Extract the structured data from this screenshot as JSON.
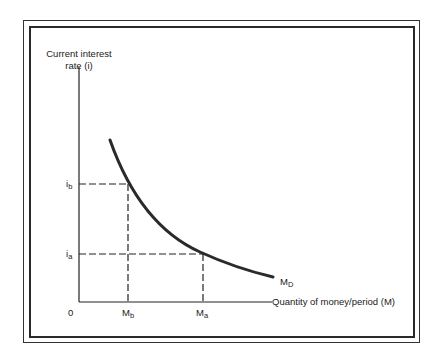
{
  "diagram": {
    "y_axis_label_line1": "Current interest",
    "y_axis_label_line2": "rate (i)",
    "x_axis_label": "Quantity of money/period  (M)",
    "origin_label": "0",
    "curve_label": "M",
    "curve_label_sub": "D",
    "y_ticks": [
      {
        "main": "i",
        "sub": "b"
      },
      {
        "main": "i",
        "sub": "a"
      }
    ],
    "x_ticks": [
      {
        "main": "M",
        "sub": "b"
      },
      {
        "main": "M",
        "sub": "a"
      }
    ],
    "colors": {
      "line": "#2a2a2a",
      "background": "#ffffff"
    }
  }
}
